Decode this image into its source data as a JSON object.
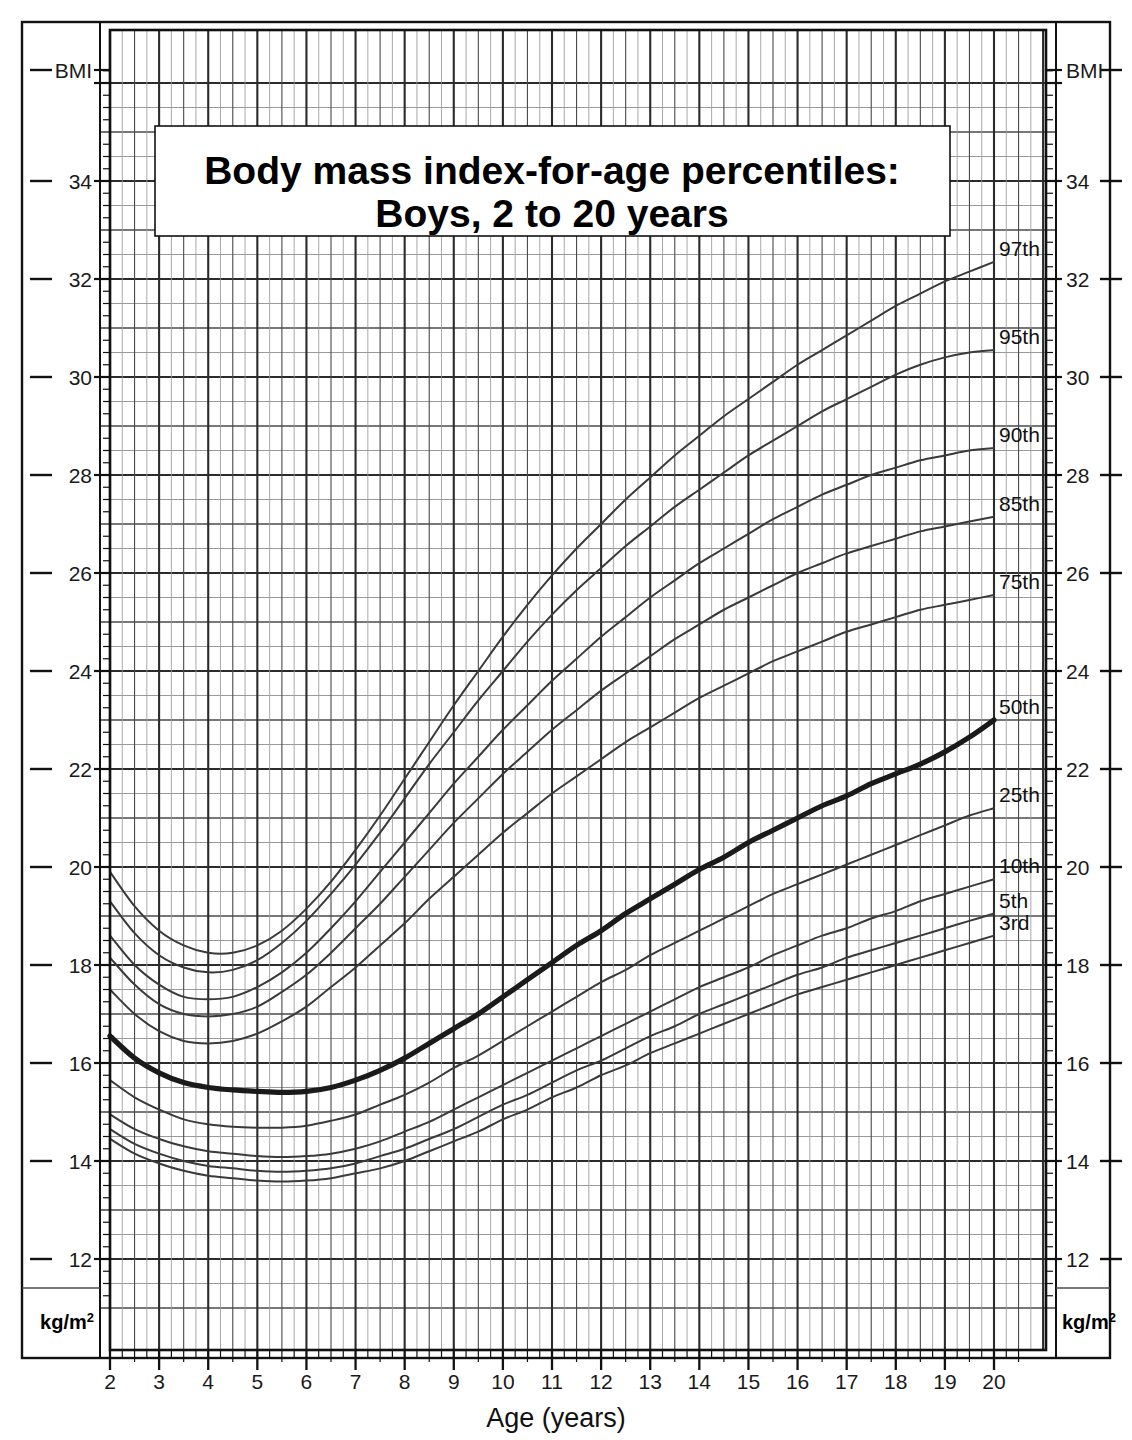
{
  "title": {
    "line1": "Body mass index-for-age percentiles:",
    "line2": "Boys, 2 to 20 years"
  },
  "axes": {
    "y_left_header": "BMI",
    "y_right_header": "BMI",
    "y_unit_left": "kg/m",
    "y_unit_left_sup": "2",
    "y_unit_right": "kg/m",
    "y_unit_right_sup": "2",
    "x_title": "Age (years)",
    "y_ticks": [
      "34",
      "32",
      "30",
      "28",
      "26",
      "24",
      "22",
      "20",
      "18",
      "16",
      "14",
      "12"
    ],
    "x_ticks": [
      "2",
      "3",
      "4",
      "5",
      "6",
      "7",
      "8",
      "9",
      "10",
      "11",
      "12",
      "13",
      "14",
      "15",
      "16",
      "17",
      "18",
      "19",
      "20"
    ]
  },
  "colors": {
    "curve": "#3a3a3a",
    "curve_median": "#1a1a1a",
    "grid_minor": "#9a9a9a",
    "grid_major": "#4a4a4a",
    "grid_bold": "#2b2b2b",
    "frame": "#111111",
    "background": "#ffffff"
  },
  "chart_data": {
    "type": "line",
    "xlabel": "Age (years)",
    "ylabel": "BMI (kg/m2)",
    "xlim": [
      2,
      20
    ],
    "ylim": [
      11.0,
      36.1
    ],
    "grid": true,
    "legend_position": "right-inline-labels",
    "x": [
      2,
      2.5,
      3,
      3.5,
      4,
      4.5,
      5,
      5.5,
      6,
      6.5,
      7,
      7.5,
      8,
      8.5,
      9,
      9.5,
      10,
      10.5,
      11,
      11.5,
      12,
      12.5,
      13,
      13.5,
      14,
      14.5,
      15,
      15.5,
      16,
      16.5,
      17,
      17.5,
      18,
      18.5,
      19,
      19.5,
      20
    ],
    "series": [
      {
        "name": "97th",
        "label": "97th",
        "values": [
          19.9,
          19.2,
          18.7,
          18.4,
          18.25,
          18.25,
          18.4,
          18.7,
          19.15,
          19.7,
          20.35,
          21.05,
          21.8,
          22.55,
          23.3,
          24.0,
          24.7,
          25.35,
          25.95,
          26.5,
          27.0,
          27.5,
          27.95,
          28.4,
          28.8,
          29.2,
          29.55,
          29.9,
          30.25,
          30.55,
          30.85,
          31.15,
          31.45,
          31.7,
          31.95,
          32.15,
          32.35
        ]
      },
      {
        "name": "95th",
        "label": "95th",
        "values": [
          19.3,
          18.65,
          18.2,
          17.95,
          17.85,
          17.9,
          18.1,
          18.45,
          18.9,
          19.45,
          20.05,
          20.7,
          21.4,
          22.1,
          22.75,
          23.4,
          24.0,
          24.6,
          25.15,
          25.65,
          26.1,
          26.55,
          26.95,
          27.35,
          27.7,
          28.05,
          28.4,
          28.7,
          29.0,
          29.3,
          29.55,
          29.8,
          30.05,
          30.25,
          30.4,
          30.5,
          30.55
        ]
      },
      {
        "name": "90th",
        "label": "90th",
        "values": [
          18.6,
          18.0,
          17.6,
          17.35,
          17.3,
          17.35,
          17.55,
          17.85,
          18.25,
          18.75,
          19.3,
          19.9,
          20.5,
          21.1,
          21.7,
          22.25,
          22.8,
          23.3,
          23.8,
          24.25,
          24.7,
          25.1,
          25.5,
          25.85,
          26.2,
          26.5,
          26.8,
          27.1,
          27.35,
          27.6,
          27.8,
          28.0,
          28.15,
          28.3,
          28.4,
          28.5,
          28.55
        ]
      },
      {
        "name": "85th",
        "label": "85th",
        "values": [
          18.15,
          17.6,
          17.2,
          17.0,
          16.95,
          17.0,
          17.15,
          17.45,
          17.8,
          18.25,
          18.75,
          19.25,
          19.8,
          20.35,
          20.9,
          21.4,
          21.9,
          22.35,
          22.8,
          23.2,
          23.6,
          23.95,
          24.3,
          24.65,
          24.95,
          25.25,
          25.5,
          25.75,
          26.0,
          26.2,
          26.4,
          26.55,
          26.7,
          26.85,
          26.95,
          27.05,
          27.15
        ]
      },
      {
        "name": "75th",
        "label": "75th",
        "values": [
          17.5,
          17.0,
          16.65,
          16.45,
          16.4,
          16.45,
          16.6,
          16.85,
          17.15,
          17.55,
          17.95,
          18.4,
          18.85,
          19.35,
          19.8,
          20.25,
          20.7,
          21.1,
          21.5,
          21.85,
          22.2,
          22.55,
          22.85,
          23.15,
          23.45,
          23.7,
          23.95,
          24.2,
          24.4,
          24.6,
          24.8,
          24.95,
          25.1,
          25.25,
          25.35,
          25.45,
          25.55
        ]
      },
      {
        "name": "50th",
        "label": "50th",
        "values": [
          16.55,
          16.1,
          15.8,
          15.6,
          15.5,
          15.45,
          15.42,
          15.4,
          15.42,
          15.5,
          15.65,
          15.85,
          16.1,
          16.4,
          16.7,
          17.0,
          17.35,
          17.7,
          18.05,
          18.4,
          18.7,
          19.05,
          19.35,
          19.65,
          19.95,
          20.2,
          20.5,
          20.75,
          21.0,
          21.25,
          21.45,
          21.7,
          21.9,
          22.1,
          22.35,
          22.65,
          23.0
        ]
      },
      {
        "name": "25th",
        "label": "25th",
        "values": [
          15.65,
          15.3,
          15.05,
          14.85,
          14.75,
          14.7,
          14.68,
          14.68,
          14.72,
          14.82,
          14.95,
          15.15,
          15.35,
          15.6,
          15.9,
          16.15,
          16.45,
          16.75,
          17.05,
          17.35,
          17.65,
          17.9,
          18.2,
          18.45,
          18.7,
          18.95,
          19.2,
          19.45,
          19.65,
          19.85,
          20.05,
          20.25,
          20.45,
          20.65,
          20.85,
          21.05,
          21.2
        ]
      },
      {
        "name": "10th",
        "label": "10th",
        "values": [
          14.95,
          14.65,
          14.45,
          14.3,
          14.2,
          14.15,
          14.1,
          14.08,
          14.1,
          14.15,
          14.25,
          14.4,
          14.6,
          14.8,
          15.05,
          15.3,
          15.55,
          15.8,
          16.05,
          16.3,
          16.55,
          16.8,
          17.05,
          17.3,
          17.55,
          17.75,
          17.95,
          18.2,
          18.4,
          18.6,
          18.75,
          18.95,
          19.1,
          19.3,
          19.45,
          19.6,
          19.75
        ]
      },
      {
        "name": "5th",
        "label": "5th",
        "values": [
          14.65,
          14.35,
          14.15,
          14.0,
          13.9,
          13.85,
          13.8,
          13.78,
          13.8,
          13.85,
          13.95,
          14.1,
          14.25,
          14.45,
          14.65,
          14.9,
          15.15,
          15.35,
          15.6,
          15.85,
          16.05,
          16.3,
          16.55,
          16.75,
          17.0,
          17.2,
          17.4,
          17.6,
          17.8,
          17.95,
          18.15,
          18.3,
          18.45,
          18.6,
          18.75,
          18.9,
          19.05
        ]
      },
      {
        "name": "3rd",
        "label": "3rd",
        "values": [
          14.45,
          14.15,
          13.95,
          13.8,
          13.7,
          13.65,
          13.6,
          13.58,
          13.6,
          13.65,
          13.75,
          13.85,
          14.0,
          14.2,
          14.4,
          14.6,
          14.85,
          15.05,
          15.3,
          15.5,
          15.75,
          15.95,
          16.2,
          16.4,
          16.6,
          16.8,
          17.0,
          17.2,
          17.4,
          17.55,
          17.7,
          17.85,
          18.0,
          18.15,
          18.3,
          18.45,
          18.6
        ]
      }
    ]
  }
}
